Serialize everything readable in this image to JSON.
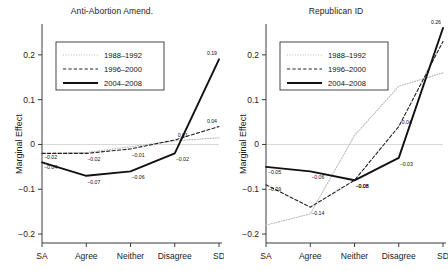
{
  "figure": {
    "ylabel": "Marginal Effect",
    "y_ticks": [
      "0.2",
      "0.1",
      "0",
      "-0.1",
      "-0.2"
    ],
    "y_tick_values": [
      0.2,
      0.1,
      0,
      -0.1,
      -0.2
    ],
    "categories": [
      "SA",
      "Agree",
      "Neither",
      "Disagree",
      "SD"
    ],
    "legend": [
      {
        "label": "1988-1992",
        "style": "dotted",
        "color": "#b9b9b9"
      },
      {
        "label": "1996-2000",
        "style": "dashed",
        "color": "#1a1a1a"
      },
      {
        "label": "2004-2008",
        "style": "solid",
        "color": "#111111"
      }
    ]
  },
  "chart_data": [
    {
      "type": "line",
      "title": "Anti-Abortion Amend.",
      "xlabel": "",
      "ylabel": "Marginal Effect",
      "categories": [
        "SA",
        "Agree",
        "Neither",
        "Disagree",
        "SD"
      ],
      "ylim": [
        -0.22,
        0.26
      ],
      "grid": false,
      "legend_position": "upper-left",
      "series": [
        {
          "name": "1988-1992",
          "values": [
            -0.02,
            -0.018,
            -0.005,
            0.008,
            0.015
          ],
          "labels": [
            "",
            "",
            "",
            "",
            ""
          ]
        },
        {
          "name": "1996-2000",
          "values": [
            -0.02,
            -0.02,
            -0.01,
            0.01,
            0.04
          ],
          "labels": [
            "-0.02",
            "-0.02",
            "-0.01",
            "0.01",
            "0.04"
          ]
        },
        {
          "name": "2004-2008",
          "values": [
            -0.04,
            -0.07,
            -0.06,
            -0.02,
            0.19
          ],
          "labels": [
            "-0.04",
            "-0.07",
            "-0.06",
            "-0.02",
            "0.19"
          ]
        }
      ]
    },
    {
      "type": "line",
      "title": "Republican ID",
      "xlabel": "",
      "ylabel": "Marginal Effect",
      "categories": [
        "SA",
        "Agree",
        "Neither",
        "Disagree",
        "SD"
      ],
      "ylim": [
        -0.22,
        0.26
      ],
      "grid": false,
      "legend_position": "upper-left",
      "series": [
        {
          "name": "1988-1992",
          "values": [
            -0.18,
            -0.155,
            0.02,
            0.13,
            0.16
          ],
          "labels": [
            "",
            "",
            "",
            "",
            ""
          ]
        },
        {
          "name": "1996-2000",
          "values": [
            -0.09,
            -0.14,
            -0.08,
            0.04,
            0.23
          ],
          "labels": [
            "-0.09",
            "-0.14",
            "-0.08",
            "0.04",
            ""
          ]
        },
        {
          "name": "2004-2008",
          "values": [
            -0.05,
            -0.06,
            -0.08,
            -0.03,
            0.26
          ],
          "labels": [
            "-0.05",
            "-0.06",
            "-0.08",
            "-0.03",
            "0.26"
          ]
        }
      ]
    }
  ]
}
